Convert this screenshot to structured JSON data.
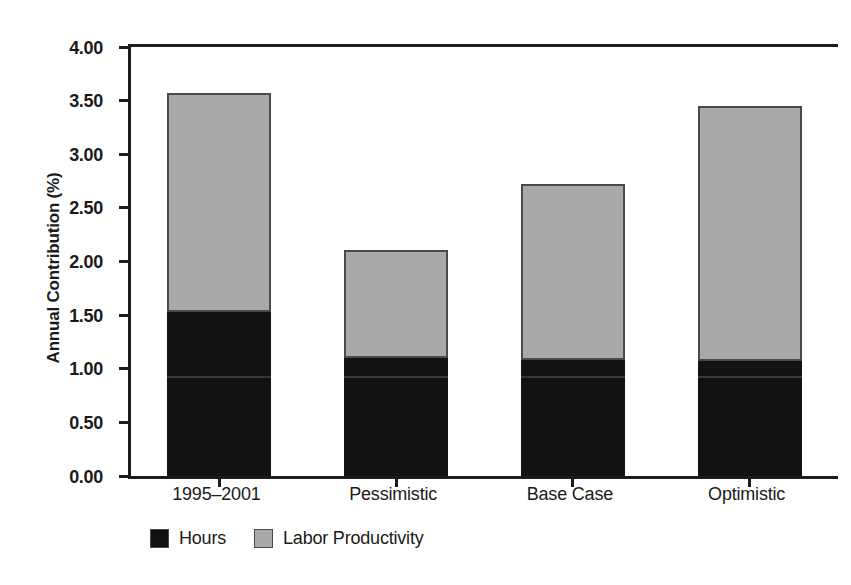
{
  "chart_data": {
    "type": "bar",
    "subtype": "stacked-vertical",
    "title": "",
    "xlabel": "",
    "ylabel": "Annual Contribution (%)",
    "ylim": [
      0,
      4
    ],
    "ytick_step": 0.5,
    "ytick_labels": [
      "4.00",
      "3.50",
      "3.00",
      "2.50",
      "2.00",
      "1.50",
      "1.00",
      "0.50",
      "0.00"
    ],
    "ytick_values": [
      4.0,
      3.5,
      3.0,
      2.5,
      2.0,
      1.5,
      1.0,
      0.5,
      0.0
    ],
    "grid": false,
    "legend_position": "bottom-left",
    "categories": [
      "1995–2001",
      "Pessimistic",
      "Base Case",
      "Optimistic"
    ],
    "series": [
      {
        "name": "Hours",
        "color": "#121212",
        "values": [
          1.53,
          1.1,
          1.08,
          1.07
        ]
      },
      {
        "name": "Labor Productivity",
        "color": "#a9a9a9",
        "values": [
          2.04,
          1.01,
          1.64,
          2.38
        ]
      }
    ],
    "totals": [
      3.57,
      2.11,
      2.72,
      3.45
    ]
  },
  "axis": {
    "y_title": "Annual Contribution (%)"
  },
  "legend": {
    "items": [
      {
        "label": "Hours",
        "color": "#121212"
      },
      {
        "label": "Labor Productivity",
        "color": "#a9a9a9"
      }
    ]
  }
}
